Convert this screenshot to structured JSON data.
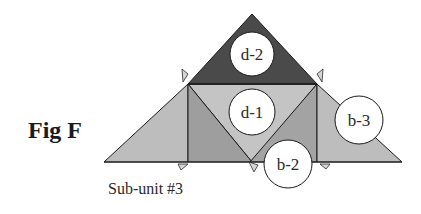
{
  "figure": {
    "title": "Fig F",
    "caption": "Sub-unit #3"
  },
  "colors": {
    "dark_triangle": "#4a4a4a",
    "light_fill": "#bdbdbd",
    "medium_fill": "#9e9e9e",
    "outline": "#1a1a1a",
    "circle_fill": "#ffffff"
  },
  "pieces": [
    {
      "id": "d-2",
      "label": "d-2",
      "shade": "dark"
    },
    {
      "id": "d-1",
      "label": "d-1",
      "shade": "light"
    },
    {
      "id": "b-2",
      "label": "b-2",
      "shade": "medium"
    },
    {
      "id": "b-3",
      "label": "b-3",
      "shade": "light"
    }
  ],
  "labels": {
    "d2": "d-2",
    "d1": "d-1",
    "b2": "b-2",
    "b3": "b-3"
  }
}
